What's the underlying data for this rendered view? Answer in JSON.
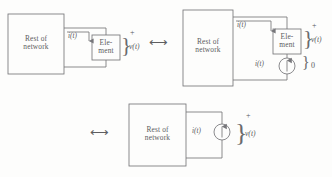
{
  "figure": {
    "type": "circuit-diagram",
    "line_color": "#76767a",
    "text_color": "#58585a",
    "background": "#fdfdfc"
  },
  "labels": {
    "rest_of_network_line1": "Rest of",
    "rest_of_network_line2": "network",
    "element_line1": "Ele-",
    "element_line2": "ment",
    "current": "i(t)",
    "voltage": "v(t)",
    "plus": "+",
    "zero": "0",
    "equivalence": "⟷"
  },
  "circuits": [
    {
      "id": "circuit-left",
      "blocks": [
        "Rest of network",
        "Element"
      ],
      "current_label": "i(t)",
      "voltage_label": "v(t)",
      "polarity": "+"
    },
    {
      "id": "circuit-right",
      "blocks": [
        "Rest of network",
        "Element"
      ],
      "current_label": "i(t)",
      "voltage_label": "v(t)",
      "source_label": "i(t)",
      "polarity": "+",
      "source_voltage": "0"
    },
    {
      "id": "circuit-bottom",
      "blocks": [
        "Rest of network"
      ],
      "source_label": "i(t)",
      "voltage_label": "v(t)",
      "polarity": "+"
    }
  ]
}
